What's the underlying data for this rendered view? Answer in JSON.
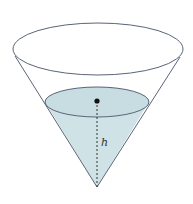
{
  "diagram": {
    "type": "cone-with-liquid",
    "labels": {
      "height": "h"
    },
    "colors": {
      "outline": "#5a6478",
      "water_fill": "#cfe3e6",
      "water_top_fill": "#c7dde1",
      "dashed_line": "#333333",
      "dot": "#111111",
      "background": "#ffffff"
    },
    "geometry": {
      "top_ellipse": {
        "cx": 98,
        "cy": 49,
        "rx": 85,
        "ry": 26
      },
      "water_ellipse": {
        "cx": 97,
        "cy": 102,
        "rx": 52,
        "ry": 15
      },
      "apex": {
        "x": 97,
        "y": 187
      },
      "dot": {
        "x": 97,
        "y": 101
      },
      "label_pos": {
        "x": 101,
        "y": 146
      }
    }
  }
}
